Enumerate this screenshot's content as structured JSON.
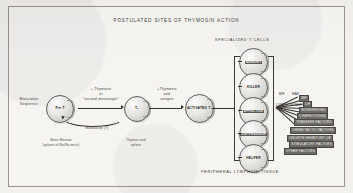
{
  "figure": {
    "title": "POSTULATED SITES OF THYMOSIN ACTION",
    "bottom_caption": "PERIPHERAL LYMPHOID TISSUE",
    "specialized_header": "SPECIALIZED T CELLS"
  },
  "stages": [
    {
      "id": "pre-t",
      "cell_label": "Pre T",
      "caption_line1": "Bone Marrow",
      "caption_line2": "(spleen of Nu/Nu mice)"
    },
    {
      "id": "t1",
      "cell_label": "T₁",
      "caption_line1": "Thymus and",
      "caption_line2": "spleen"
    },
    {
      "id": "activated-t2",
      "cell_label": "ACTIVATED T₂",
      "caption_line1": "",
      "caption_line2": ""
    }
  ],
  "annotations": {
    "maturation_sequence_line1": "Maturation",
    "maturation_sequence_line2": "Sequence",
    "arrow1_line1": "+ Thymosin",
    "arrow1_line2": "or",
    "arrow1_line3": "\"second messenger\"",
    "arrow2_line1": "+Thymosin",
    "arrow2_line2": "and",
    "arrow2_line3": "antigen",
    "modulation": "Modulation (?)"
  },
  "specialized_cells": [
    {
      "label": "MEMORY",
      "highlighted": true
    },
    {
      "label": "KILLER",
      "highlighted": false
    },
    {
      "label": "EFFECTOR",
      "highlighted": true
    },
    {
      "label": "SUPPRESSOR",
      "highlighted": true
    },
    {
      "label": "HELPER",
      "highlighted": false
    }
  ],
  "lymphokines": {
    "group_label": "LYMPHOKINES",
    "top_labels": [
      "MIF",
      "MAF"
    ],
    "items": [
      "MIF",
      "LIF",
      "INTERFERONS",
      "LYMPHOTOXINS",
      "TRANSFER FACTORS",
      "CHEMOTACTIC FACTORS",
      "GROWTH INHIBITORY OR",
      "STIMULATORY FACTORS",
      "OTHER FACTORS"
    ]
  },
  "colors": {
    "paper": "#f5f4f1",
    "ink": "#35332f",
    "cell_fill": "#e4e3df",
    "highlight": "#6d6b66"
  }
}
